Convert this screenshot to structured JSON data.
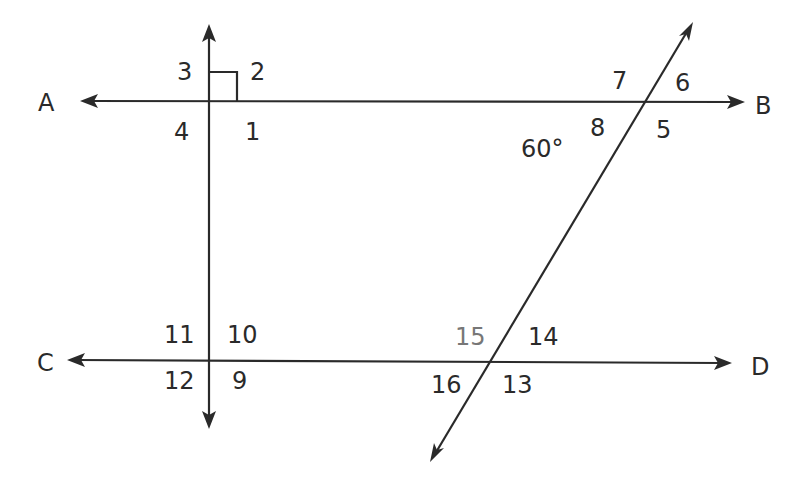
{
  "diagram": {
    "points": {
      "A": "A",
      "B": "B",
      "C": "C",
      "D": "D"
    },
    "given_angle": "60°",
    "right_angle_marker": "right-angle",
    "angles": {
      "a1": "1",
      "a2": "2",
      "a3": "3",
      "a4": "4",
      "a5": "5",
      "a6": "6",
      "a7": "7",
      "a8": "8",
      "a9": "9",
      "a10": "10",
      "a11": "11",
      "a12": "12",
      "a13": "13",
      "a14": "14",
      "a15": "15",
      "a16": "16"
    },
    "colors": {
      "line": "#2a2a2a",
      "highlight_label": "#777777",
      "background": "#ffffff"
    }
  }
}
